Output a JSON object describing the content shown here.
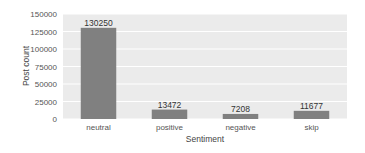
{
  "chart_data": {
    "type": "bar",
    "title": "",
    "xlabel": "Sentiment",
    "ylabel": "Post count",
    "categories": [
      "neutral",
      "positive",
      "negative",
      "skip"
    ],
    "values": [
      130250,
      13472,
      7208,
      11677
    ],
    "value_labels": [
      "130250",
      "13472",
      "7208",
      "11677"
    ],
    "ylim": [
      0,
      150000
    ],
    "yticks": [
      0,
      25000,
      50000,
      75000,
      100000,
      125000,
      150000
    ],
    "ytick_labels": [
      "0",
      "25000",
      "50000",
      "75000",
      "100000",
      "125000",
      "150000"
    ],
    "grid": true,
    "legend": null,
    "colors": {
      "bar": "#808080",
      "plot_background": "#ebebeb",
      "grid": "#ffffff"
    }
  }
}
